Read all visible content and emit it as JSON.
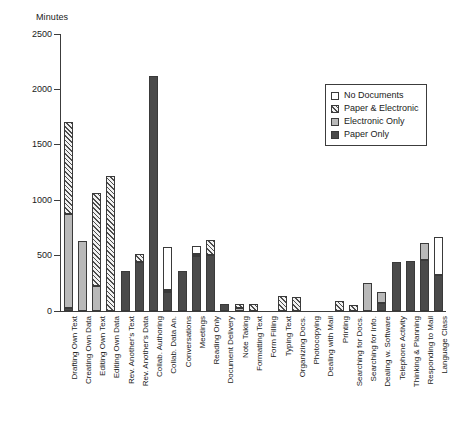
{
  "chart_data": {
    "type": "bar",
    "title": "",
    "xlabel": "",
    "ylabel": "Minutes",
    "ylim": [
      0,
      2500
    ],
    "yticks": [
      0,
      500,
      1000,
      1500,
      2000,
      2500
    ],
    "grid": false,
    "stacked": true,
    "legend_position": "top-right",
    "categories": [
      "Drafting Own Text",
      "Creating Own Data",
      "Editing Own Text",
      "Editing Own Data",
      "Rev. Another's Text",
      "Rev. Another's Data",
      "Collab. Authoring",
      "Collab. Data An.",
      "Conversations",
      "Meetings",
      "Reading Only",
      "Document Delivery",
      "Note Taking",
      "Formatting Text",
      "Form Filling",
      "Typing Text",
      "Organizing Docs.",
      "Photocopying",
      "Dealing with Mail",
      "Printing",
      "Searching for Docs.",
      "Searching for Info.",
      "Dealing w. Software",
      "Telephone Activity",
      "Thinking & Planning",
      "Responding to Mail",
      "Language Class"
    ],
    "series": [
      {
        "name": "Paper Only",
        "color": "#4a4a4a",
        "values": [
          30,
          0,
          0,
          0,
          360,
          440,
          2120,
          170,
          365,
          495,
          505,
          60,
          0,
          0,
          0,
          0,
          0,
          0,
          0,
          0,
          0,
          0,
          70,
          440,
          450,
          460,
          325
        ]
      },
      {
        "name": "Electronic Only",
        "color": "#b9b9b9",
        "values": [
          850,
          630,
          225,
          0,
          0,
          0,
          0,
          20,
          0,
          20,
          0,
          0,
          25,
          0,
          0,
          0,
          0,
          0,
          0,
          0,
          0,
          250,
          105,
          0,
          0,
          150,
          0
        ]
      },
      {
        "name": "Paper & Electronic",
        "color": "#cfcfcf",
        "values": [
          830,
          0,
          840,
          1215,
          0,
          75,
          0,
          0,
          0,
          0,
          135,
          0,
          40,
          65,
          0,
          140,
          130,
          0,
          0,
          90,
          50,
          0,
          0,
          0,
          0,
          0,
          0
        ]
      },
      {
        "name": "No Documents",
        "color": "#ffffff",
        "values": [
          0,
          0,
          0,
          0,
          0,
          0,
          0,
          385,
          0,
          75,
          0,
          0,
          0,
          0,
          0,
          0,
          0,
          0,
          0,
          0,
          0,
          0,
          0,
          0,
          0,
          0,
          340
        ]
      }
    ]
  },
  "legend": {
    "items": [
      {
        "label": "No Documents",
        "swatch": "c-none"
      },
      {
        "label": "Paper & Electronic",
        "swatch": "c-both"
      },
      {
        "label": "Electronic Only",
        "swatch": "c-elec"
      },
      {
        "label": "Paper Only",
        "swatch": "c-paper"
      }
    ]
  }
}
